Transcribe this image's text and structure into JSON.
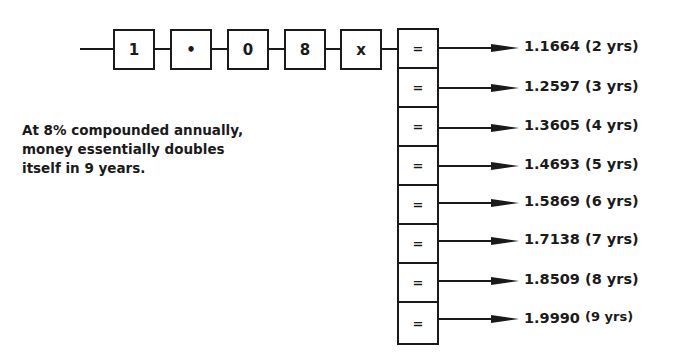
{
  "keys": [
    {
      "label": "1",
      "left": 113
    },
    {
      "label": "•",
      "left": 170
    },
    {
      "label": "0",
      "left": 227
    },
    {
      "label": "8",
      "left": 284
    },
    {
      "label": "x",
      "left": 340
    }
  ],
  "equals_label": "=",
  "results": [
    {
      "value": "1.1664",
      "years": "(2 yrs)"
    },
    {
      "value": "1.2597",
      "years": "(3 yrs)"
    },
    {
      "value": "1.3605",
      "years": "(4 yrs)"
    },
    {
      "value": "1.4693",
      "years": "(5 yrs)"
    },
    {
      "value": "1.5869",
      "years": "(6 yrs)"
    },
    {
      "value": "1.7138",
      "years": "(7 yrs)"
    },
    {
      "value": "1.8509",
      "years": "(8 yrs)"
    },
    {
      "value": "1.9990",
      "years": "(9 yrs)"
    }
  ],
  "note": {
    "line1": "At 8% compounded annually,",
    "line2": "money essentially doubles",
    "line3": "itself in 9 years."
  }
}
